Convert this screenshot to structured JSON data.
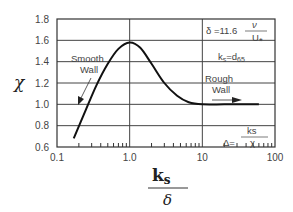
{
  "chart_data": {
    "type": "line",
    "title": "",
    "xlabel": "ks / δ",
    "xlabel_numerator": "k",
    "xlabel_numerator_sub": "s",
    "xlabel_denominator": "δ",
    "ylabel": "χ",
    "xscale": "log",
    "xlim": [
      0.1,
      100
    ],
    "ylim": [
      0.6,
      1.8
    ],
    "grid": true,
    "x_tick_labels": [
      "0.1",
      "1.0",
      "10",
      "100"
    ],
    "y_tick_labels": [
      "0.6",
      "0.8",
      "1.0",
      "1.2",
      "1.4",
      "1.6",
      "1.8"
    ],
    "series": [
      {
        "name": "chi",
        "x": [
          0.17,
          0.25,
          0.35,
          0.5,
          0.7,
          1.0,
          1.4,
          2.0,
          3.0,
          4.5,
          6.5,
          10,
          20,
          40,
          60
        ],
        "values": [
          0.68,
          0.95,
          1.18,
          1.38,
          1.52,
          1.58,
          1.53,
          1.38,
          1.2,
          1.08,
          1.02,
          1.0,
          1.0,
          1.0,
          1.0
        ]
      }
    ],
    "annotations": [
      {
        "text": "Smooth Wall",
        "x": 0.25,
        "y": 1.43
      },
      {
        "text": "Rough Wall",
        "x": 15,
        "y": 1.15
      },
      {
        "text": "δ = 11.6 ν / U*",
        "x": 30,
        "y": 1.72
      },
      {
        "text": "ks = d65",
        "x": 30,
        "y": 1.52
      },
      {
        "text": "Δ = ks / χ",
        "x": 40,
        "y": 0.67
      }
    ]
  },
  "labels": {
    "y_axis": "χ",
    "x_num": "k",
    "x_num_sub": "s",
    "x_den": "δ",
    "smooth_line1": "Smooth",
    "smooth_line2": "Wall",
    "rough_line1": "Rough",
    "rough_line2": "Wall",
    "delta_def_left": "δ =11.6",
    "delta_def_num": "ν",
    "delta_def_den": "U",
    "delta_def_den_sub": "*",
    "ks_def": "k",
    "ks_def_sub": "s",
    "ks_def_eq": "=d",
    "ks_def_eq_sub": "65",
    "Delta_def_left": "Δ=",
    "Delta_def_num": "ks",
    "Delta_def_den": "χ",
    "x_ticks": [
      "0.1",
      "1.0",
      "10",
      "100"
    ],
    "y_ticks": [
      "1.8",
      "1.6",
      "1.4",
      "1.2",
      "1.0",
      "0.8",
      "0.6"
    ]
  }
}
